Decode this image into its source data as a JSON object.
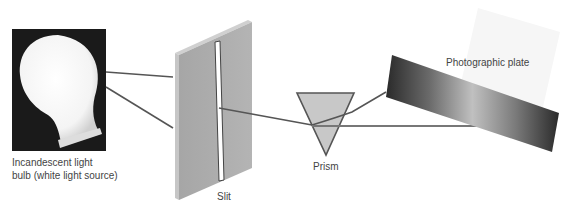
{
  "diagram": {
    "components": [
      {
        "id": "bulb",
        "label_line1": "Incandescent light",
        "label_line2": "bulb (white light source)"
      },
      {
        "id": "slit",
        "label": "Slit"
      },
      {
        "id": "prism",
        "label": "Prism"
      },
      {
        "id": "plate",
        "label": "Photographic plate"
      }
    ],
    "colors": {
      "background": "#ffffff",
      "bulb_frame": "#1a1a1a",
      "bulb_glow": "#ffffff",
      "slit_face": "#aaaaaa",
      "slit_side": "#c4c4c4",
      "prism_fill": "#c8c8c8",
      "ray": "#555555",
      "plate_dark": "#2a2a2a",
      "plate_light": "#b8b8b8",
      "label_text": "#444444"
    }
  }
}
